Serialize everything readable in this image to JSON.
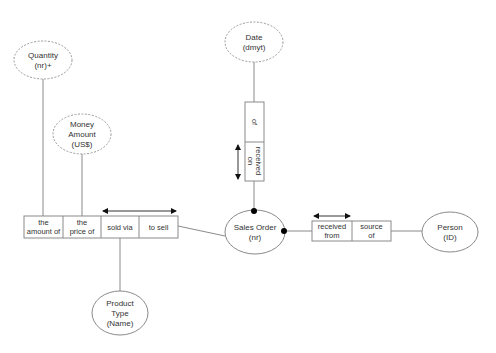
{
  "diagram": {
    "type": "ORM fact-type diagram",
    "value_types": [
      {
        "id": "quantity",
        "lines": [
          "Quantity",
          "(nr)+"
        ]
      },
      {
        "id": "money_amount",
        "lines": [
          "Money",
          "Amount",
          "(US$)"
        ]
      },
      {
        "id": "date",
        "lines": [
          "Date",
          "(dmyt)"
        ]
      }
    ],
    "entity_types": [
      {
        "id": "sales_order",
        "lines": [
          "Sales Order",
          "(nr)"
        ]
      },
      {
        "id": "person",
        "lines": [
          "Person",
          "(ID)"
        ]
      },
      {
        "id": "product_type",
        "lines": [
          "Product",
          "Type",
          "(Name)"
        ]
      }
    ],
    "fact_types": [
      {
        "id": "quaternary",
        "roles": [
          {
            "lines": [
              "the",
              "amount of"
            ]
          },
          {
            "lines": [
              "the",
              "price of"
            ]
          },
          {
            "lines": [
              "sold via"
            ]
          },
          {
            "lines": [
              "to sell"
            ]
          }
        ]
      },
      {
        "id": "date_fact",
        "roles": [
          {
            "lines": [
              "of"
            ]
          },
          {
            "lines": [
              "received",
              "on"
            ]
          }
        ]
      },
      {
        "id": "person_fact",
        "roles": [
          {
            "lines": [
              "received",
              "from"
            ]
          },
          {
            "lines": [
              "source",
              "of"
            ]
          }
        ]
      }
    ],
    "colors": {
      "line": "#8a8a8a",
      "text": "#333333",
      "marker": "#000000"
    }
  }
}
